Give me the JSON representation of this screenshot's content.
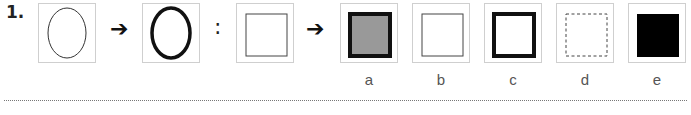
{
  "question": {
    "number": "1.",
    "arrow_symbol": "➔",
    "colon_symbol": ":",
    "premise": [
      {
        "shape": "ellipse",
        "stroke": "thin",
        "fill": "none"
      },
      {
        "shape": "ellipse",
        "stroke": "thick",
        "fill": "none"
      }
    ],
    "query": {
      "shape": "square",
      "stroke": "thin",
      "fill": "none"
    },
    "options": [
      {
        "label": "a",
        "shape": "square",
        "stroke": "thick",
        "fill": "#999999"
      },
      {
        "label": "b",
        "shape": "square",
        "stroke": "thin",
        "fill": "none"
      },
      {
        "label": "c",
        "shape": "square",
        "stroke": "thick",
        "fill": "none"
      },
      {
        "label": "d",
        "shape": "square",
        "stroke": "dashed",
        "fill": "none"
      },
      {
        "label": "e",
        "shape": "square",
        "stroke": "none",
        "fill": "#000000"
      }
    ]
  }
}
